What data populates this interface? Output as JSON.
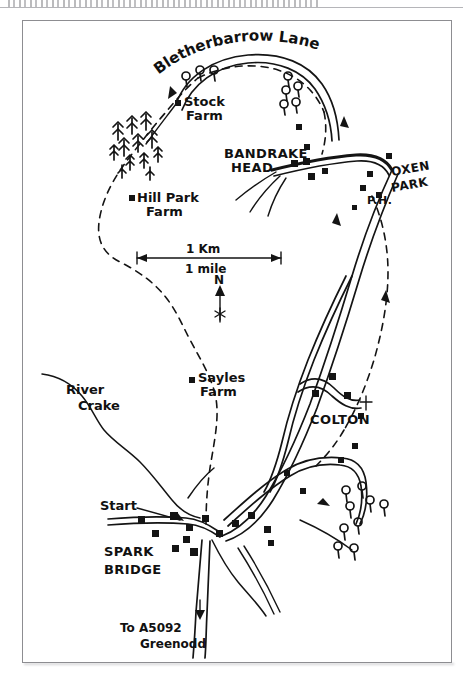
{
  "page": {
    "kind": "scanned-hand-drawn-walking-map",
    "header_strip_text": ""
  },
  "map": {
    "title_road": "Bletherbarrow Lane",
    "scale": {
      "metric_label": "1 Km",
      "imperial_label": "1 mile"
    },
    "compass": {
      "north_label": "N"
    },
    "places": [
      {
        "id": "stock-farm",
        "label_line1": "Stock",
        "label_line2": "Farm",
        "type": "farm"
      },
      {
        "id": "hill-park-farm",
        "label_line1": "Hill Park",
        "label_line2": "Farm",
        "type": "farm"
      },
      {
        "id": "sayles-farm",
        "label_line1": "Sayles",
        "label_line2": "Farm",
        "type": "farm"
      },
      {
        "id": "bandrake-head",
        "label_line1": "BANDRAKE",
        "label_line2": "HEAD",
        "type": "settlement"
      },
      {
        "id": "oxen-park",
        "label_line1": "OXEN",
        "label_line2": "PARK",
        "type": "settlement"
      },
      {
        "id": "colton",
        "label_line1": "COLTON",
        "label_line2": "",
        "type": "settlement"
      },
      {
        "id": "spark-bridge",
        "label_line1": "SPARK",
        "label_line2": "BRIDGE",
        "type": "settlement"
      }
    ],
    "annotations": {
      "pub_label": "P.H.",
      "start_label": "Start",
      "river_line1": "River",
      "river_line2": "Crake",
      "destination_line1": "To A5092",
      "destination_line2": "Greenodd"
    }
  }
}
